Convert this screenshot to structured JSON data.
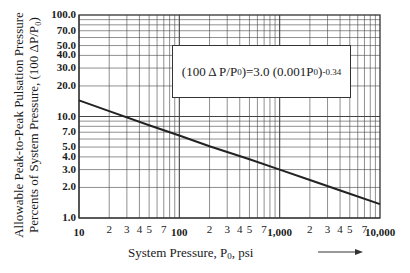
{
  "chart_data": {
    "type": "line",
    "title": "",
    "xlabel": "System Pressure, P₀, psi",
    "ylabel_line1": "Allowable Peak-to-Peak Pulsation Pressure",
    "ylabel_line2": "Percents of System Pressure, (100 ΔP/P₀)",
    "xscale": "log",
    "yscale": "log",
    "xlim": [
      10,
      10000
    ],
    "ylim": [
      1.0,
      100.0
    ],
    "grid": true,
    "x_ticks_major": [
      "10",
      "100",
      "1,000",
      "10,000"
    ],
    "x_ticks_minor": [
      "2",
      "3",
      "4",
      "5",
      "7"
    ],
    "y_ticks": [
      "100.0",
      "70.0",
      "50.0",
      "40.0",
      "30.0",
      "20.0",
      "10.0",
      "7.0",
      "5.0",
      "4.0",
      "3.0",
      "2.0",
      "1.0"
    ],
    "annotation": {
      "text_prefix": "(100 Δ P/P",
      "sub": "0",
      "text_mid": ")=3.0 (0.001P",
      "sub2": "0",
      "text_end": ")",
      "exponent": "-0.34"
    },
    "series": [
      {
        "name": "(100ΔP/P0)=3.0(0.001P0)^-0.34",
        "x": [
          10,
          20,
          50,
          100,
          200,
          500,
          1000,
          2000,
          5000,
          10000
        ],
        "y": [
          14.4,
          11.3,
          8.2,
          6.5,
          5.1,
          3.8,
          3.0,
          2.37,
          1.73,
          1.37
        ]
      }
    ],
    "arrow": "→"
  },
  "labels": {
    "x_axis_title": "System Pressure, P",
    "x_axis_sub": "0",
    "x_axis_unit": ",  psi"
  }
}
